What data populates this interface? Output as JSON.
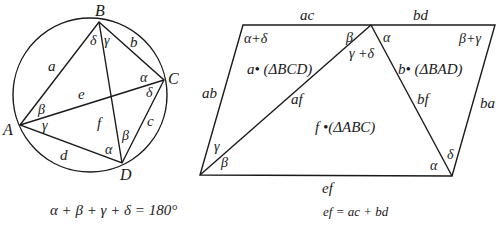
{
  "left_figure": {
    "vertices": {
      "A": "A",
      "B": "B",
      "C": "C",
      "D": "D"
    },
    "sides": {
      "a": "a",
      "b": "b",
      "c": "c",
      "d": "d"
    },
    "diagonals": {
      "e": "e",
      "f": "f"
    },
    "angles": {
      "B_left": "δ",
      "B_right": "γ",
      "C_top": "α",
      "C_bottom": "δ",
      "D_left": "α",
      "D_right": "β",
      "A_top": "β",
      "A_bottom": "γ"
    },
    "caption": "α + β + γ + δ = 180°"
  },
  "right_figure": {
    "edges": {
      "top_left": "ac",
      "top_right": "bd",
      "left": "ab",
      "right": "ba",
      "bottom": "ef",
      "diag_left": "af",
      "diag_right": "bf"
    },
    "angles": {
      "top_left_corner": "α+δ",
      "apex_left": "β",
      "apex_mid": "γ +δ",
      "apex_right": "α",
      "top_right_corner": "β+γ",
      "bottom_left_top": "γ",
      "bottom_left_bottom": "β",
      "bottom_right_left": "α",
      "bottom_right_right": "δ"
    },
    "regions": {
      "left_triangle": "a• (ΔBCD)",
      "right_triangle": "b• (ΔBAD)",
      "middle_triangle": "f •(ΔABC)"
    },
    "caption": "ef = ac + bd"
  }
}
